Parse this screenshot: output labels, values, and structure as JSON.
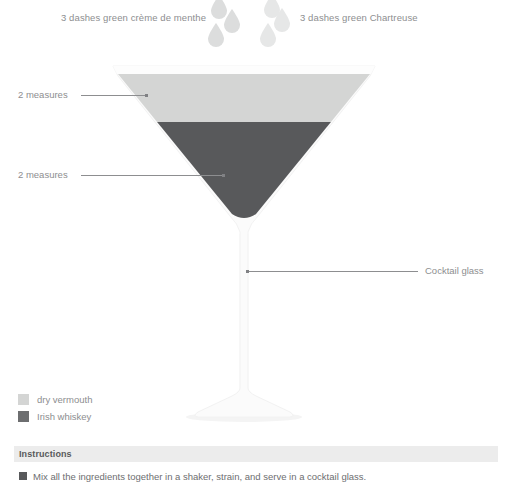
{
  "diagram": {
    "top_labels": [
      {
        "id": "creme",
        "text": "3 dashes green crème de menthe"
      },
      {
        "id": "chartreuse",
        "text": "3 dashes green Chartreuse"
      }
    ],
    "annotations": [
      {
        "id": "top-layer",
        "text": "2 measures"
      },
      {
        "id": "bottom-layer",
        "text": "2 measures"
      },
      {
        "id": "glassware",
        "text": "Cocktail glass"
      }
    ],
    "droplets": {
      "icon": "droplet-icon",
      "left_group_count": 3,
      "right_group_count": 3,
      "color_left": "#dcdddd",
      "color_right": "#e6e7e7"
    },
    "glass": {
      "icon": "cocktail-glass-icon",
      "body_color": "#fbfbfb",
      "outline_color": "#f2f2f2",
      "shadow_color": "#f4f4f4"
    },
    "layers": [
      {
        "name": "dry vermouth",
        "color": "#d4d5d4",
        "position": "top"
      },
      {
        "name": "Irish whiskey",
        "color": "#58595b",
        "position": "bottom"
      }
    ]
  },
  "legend": {
    "items": [
      {
        "label": "dry vermouth",
        "color": "#d4d5d4"
      },
      {
        "label": "Irish whiskey",
        "color": "#6d6e70"
      }
    ]
  },
  "instructions": {
    "title": "Instructions",
    "steps": [
      {
        "number": "",
        "text": "Mix all the ingredients together in a shaker, strain, and serve in a cocktail glass."
      }
    ]
  }
}
